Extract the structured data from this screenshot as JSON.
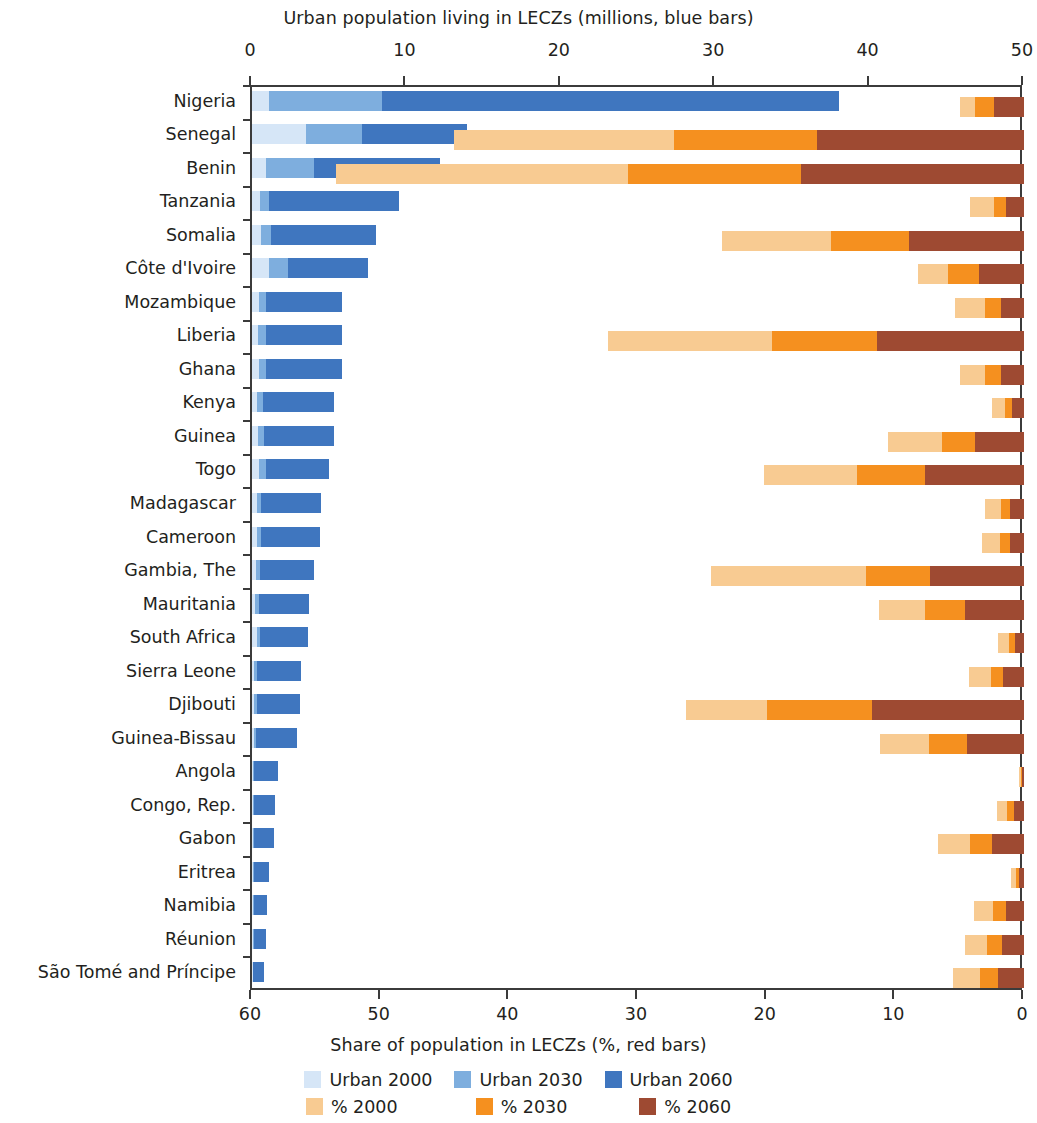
{
  "chart_data": {
    "type": "bar",
    "orientation": "horizontal",
    "subtype": "diverging-stacked-bidirectional",
    "title": "",
    "top_axis_label": "Urban population living in LECZs (millions, blue bars)",
    "bottom_axis_label": "Share of population in LECZs (%, red bars)",
    "top_axis_ticks": [
      0,
      10,
      20,
      30,
      40,
      50
    ],
    "top_axis_range": [
      0,
      50
    ],
    "bottom_axis_ticks": [
      60,
      50,
      40,
      30,
      20,
      10,
      0
    ],
    "bottom_axis_range": [
      60,
      0
    ],
    "bottom_axis_reversed": true,
    "grid": false,
    "legend_position": "bottom",
    "legend": [
      {
        "label": "Urban 2000",
        "color": "#d6e6f7",
        "series": "urban_2000"
      },
      {
        "label": "Urban 2030",
        "color": "#7eaede",
        "series": "urban_2030"
      },
      {
        "label": "Urban 2060",
        "color": "#3f76bf",
        "series": "urban_2060"
      },
      {
        "label": "% 2000",
        "color": "#f8cb92",
        "series": "pct_2000"
      },
      {
        "label": "% 2030",
        "color": "#f5901f",
        "series": "pct_2030"
      },
      {
        "label": "% 2060",
        "color": "#9e4a32",
        "series": "pct_2060"
      }
    ],
    "categories": [
      "Nigeria",
      "Senegal",
      "Benin",
      "Tanzania",
      "Somalia",
      "Côte d'Ivoire",
      "Mozambique",
      "Liberia",
      "Ghana",
      "Kenya",
      "Guinea",
      "Togo",
      "Madagascar",
      "Cameroon",
      "Gambia, The",
      "Mauritania",
      "South Africa",
      "Sierra Leone",
      "Djibouti",
      "Guinea-Bissau",
      "Angola",
      "Congo, Rep.",
      "Gabon",
      "Eritrea",
      "Namibia",
      "Réunion",
      "São Tomé and Príncipe"
    ],
    "series": [
      {
        "name": "Urban 2000",
        "key": "urban_2000",
        "unit": "millions",
        "values": [
          1.1,
          3.5,
          0.9,
          0.5,
          0.6,
          1.1,
          0.45,
          0.4,
          0.45,
          0.35,
          0.4,
          0.45,
          0.3,
          0.3,
          0.25,
          0.2,
          0.3,
          0.15,
          0.15,
          0.1,
          0.08,
          0.08,
          0.08,
          0.05,
          0.05,
          0.05,
          0.03
        ]
      },
      {
        "name": "Urban 2030",
        "key": "urban_2030",
        "unit": "millions",
        "values": [
          8.4,
          7.1,
          4.0,
          1.1,
          1.2,
          2.3,
          0.9,
          0.9,
          0.9,
          0.7,
          0.8,
          0.9,
          0.6,
          0.6,
          0.5,
          0.45,
          0.55,
          0.3,
          0.3,
          0.25,
          0.15,
          0.15,
          0.15,
          0.1,
          0.1,
          0.1,
          0.06
        ]
      },
      {
        "name": "Urban 2060",
        "key": "urban_2060",
        "unit": "millions",
        "values": [
          38.0,
          13.9,
          12.2,
          9.5,
          8.0,
          7.5,
          5.8,
          5.8,
          5.8,
          5.3,
          5.3,
          5.0,
          4.5,
          4.4,
          4.0,
          3.7,
          3.6,
          3.2,
          3.1,
          2.9,
          1.7,
          1.5,
          1.4,
          1.1,
          1.0,
          0.9,
          0.8
        ]
      },
      {
        "name": "% 2000",
        "key": "pct_2000",
        "unit": "percent",
        "values": [
          5.0,
          44.3,
          53.5,
          4.2,
          23.5,
          8.2,
          5.4,
          32.3,
          5.0,
          2.5,
          10.6,
          20.2,
          3.0,
          3.3,
          24.3,
          11.3,
          2.0,
          4.3,
          26.3,
          11.2,
          0.4,
          2.1,
          6.7,
          1.0,
          3.9,
          4.6,
          5.5
        ]
      },
      {
        "name": "% 2030",
        "key": "pct_2030",
        "unit": "percent",
        "values": [
          3.8,
          27.2,
          30.8,
          2.3,
          15.0,
          5.9,
          3.0,
          19.6,
          3.0,
          1.5,
          6.4,
          13.0,
          1.8,
          1.9,
          12.3,
          7.7,
          1.2,
          2.6,
          20.0,
          7.4,
          0.25,
          1.3,
          4.2,
          0.6,
          2.4,
          2.9,
          3.4
        ]
      },
      {
        "name": "% 2060",
        "key": "pct_2060",
        "unit": "percent",
        "values": [
          2.3,
          16.1,
          17.3,
          1.4,
          8.9,
          3.5,
          1.8,
          11.4,
          1.8,
          0.9,
          3.8,
          7.7,
          1.1,
          1.1,
          7.3,
          4.6,
          0.7,
          1.6,
          11.8,
          4.4,
          0.15,
          0.8,
          2.5,
          0.35,
          1.4,
          1.7,
          2.0
        ]
      }
    ]
  }
}
